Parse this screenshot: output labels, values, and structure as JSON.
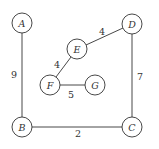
{
  "diagram": {
    "type": "weighted-graph",
    "nodes": [
      {
        "id": "A",
        "label": "A",
        "x": 22,
        "y": 23
      },
      {
        "id": "D",
        "label": "D",
        "x": 132,
        "y": 24
      },
      {
        "id": "E",
        "label": "E",
        "x": 77,
        "y": 49
      },
      {
        "id": "F",
        "label": "F",
        "x": 50,
        "y": 85
      },
      {
        "id": "G",
        "label": "G",
        "x": 95,
        "y": 85
      },
      {
        "id": "B",
        "label": "B",
        "x": 22,
        "y": 127
      },
      {
        "id": "C",
        "label": "C",
        "x": 132,
        "y": 127
      }
    ],
    "edges": [
      {
        "from": "A",
        "to": "B",
        "weight": "9"
      },
      {
        "from": "B",
        "to": "C",
        "weight": "2"
      },
      {
        "from": "D",
        "to": "C",
        "weight": "7"
      },
      {
        "from": "E",
        "to": "D",
        "weight": "4"
      },
      {
        "from": "F",
        "to": "E",
        "weight": "4"
      },
      {
        "from": "F",
        "to": "G",
        "weight": "5"
      }
    ]
  }
}
